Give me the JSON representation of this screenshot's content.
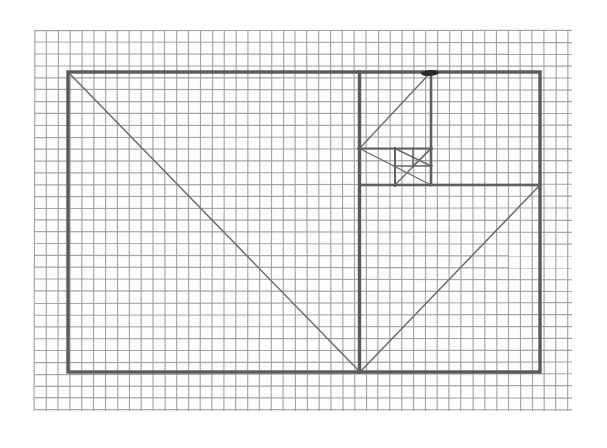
{
  "document": {
    "title": "Whirling Rectangles Construction",
    "medium": "pencil on graph paper",
    "background_color": "#ffffff",
    "paper_color": "#fdfdfc"
  },
  "grid": {
    "label": "graph-paper-grid",
    "cell_size_px": 11.85,
    "origin_x": 34.5,
    "origin_y": 30.5,
    "columns": 46,
    "rows": 32,
    "right_edge": 572,
    "bottom_edge": 411,
    "minor_color": "#9a9a9a",
    "major_color": "#8a8a8a",
    "major_every": 0
  },
  "figure": {
    "name": "golden-rectangle-whirling-squares",
    "stroke_color": "#5a5a5a",
    "diagonal_color": "#6d6d6d",
    "pole_color": "#2b2b2b",
    "outer_rectangle": {
      "name": "outer-rectangle",
      "x1": 68,
      "y1": 72,
      "x2": 540,
      "y2": 372,
      "width": 472,
      "height": 300
    },
    "divider_vertical_main": {
      "name": "main-vertical-divider",
      "x": 359.5,
      "y1": 72,
      "y2": 372
    },
    "divider_horizontal_second": {
      "name": "second-horizontal-divider",
      "x1": 359.5,
      "y1": 185,
      "x2": 540,
      "y2": 185
    },
    "divider_vertical_third": {
      "name": "third-vertical-divider",
      "x": 431,
      "y1": 72,
      "y2": 185
    },
    "divider_horizontal_fourth": {
      "name": "fourth-horizontal-divider",
      "x1": 359.5,
      "y1": 148.5,
      "x2": 431,
      "y2": 148.5
    },
    "divider_vertical_fifth": {
      "name": "fifth-vertical-divider",
      "x": 395,
      "y1": 148.5,
      "y2": 185
    },
    "divider_horizontal_sixth": {
      "name": "sixth-horizontal-divider",
      "x1": 395,
      "y1": 166,
      "x2": 431,
      "y2": 166
    },
    "divider_vertical_seventh": {
      "name": "seventh-vertical-divider",
      "x": 413,
      "y1": 148.5,
      "y2": 166
    },
    "diagonals": [
      {
        "name": "primary-diagonal",
        "x1": 68,
        "y1": 72,
        "x2": 360,
        "y2": 372,
        "direction": "down-right"
      },
      {
        "name": "secondary-diagonal",
        "x1": 540,
        "y1": 185,
        "x2": 360,
        "y2": 372,
        "direction": "down-left"
      },
      {
        "name": "tertiary-diagonal",
        "x1": 359.5,
        "y1": 148.5,
        "x2": 431,
        "y2": 72,
        "direction": "up-right"
      },
      {
        "name": "quaternary-diagonal",
        "x1": 431,
        "y1": 185,
        "x2": 359.5,
        "y2": 148.5,
        "direction": "up-left"
      },
      {
        "name": "quinary-diagonal",
        "x1": 395,
        "y1": 185,
        "x2": 431,
        "y2": 148.5,
        "direction": "up-right"
      },
      {
        "name": "senary-diagonal",
        "x1": 431,
        "y1": 166,
        "x2": 395,
        "y2": 148.5,
        "direction": "up-left"
      },
      {
        "name": "septenary-diagonal",
        "x1": 413,
        "y1": 166,
        "x2": 431,
        "y2": 148.5,
        "direction": "up-right"
      }
    ],
    "pole_point": {
      "name": "convergence-pole",
      "x": 430,
      "y": 73,
      "width": 18,
      "height": 6,
      "description": "dark arrowhead mark at top where diagonals converge"
    }
  },
  "nested_squares": [
    {
      "name": "square-1",
      "x1": 359.5,
      "y1": 72,
      "x2": 540,
      "y2": 185,
      "order": 1
    },
    {
      "name": "square-2",
      "x1": 359.5,
      "y1": 185,
      "x2": 540,
      "y2": 372,
      "order": 2
    },
    {
      "name": "square-3",
      "x1": 359.5,
      "y1": 72,
      "x2": 431,
      "y2": 148.5,
      "order": 3
    },
    {
      "name": "square-4",
      "x1": 359.5,
      "y1": 148.5,
      "x2": 431,
      "y2": 185,
      "order": 4
    },
    {
      "name": "square-5",
      "x1": 395,
      "y1": 148.5,
      "x2": 431,
      "y2": 185,
      "order": 5
    },
    {
      "name": "square-6",
      "x1": 395,
      "y1": 148.5,
      "x2": 431,
      "y2": 166,
      "order": 6
    },
    {
      "name": "square-7",
      "x1": 413,
      "y1": 148.5,
      "x2": 431,
      "y2": 166,
      "order": 7
    }
  ]
}
